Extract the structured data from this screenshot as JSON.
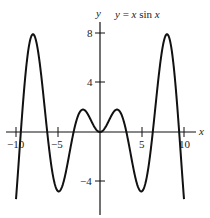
{
  "chart_data": {
    "type": "line",
    "title": "y = x sin x",
    "xlabel": "x",
    "ylabel": "y",
    "xlim": [
      -10.5,
      11.5
    ],
    "ylim": [
      -6.5,
      8.5
    ],
    "grid": false,
    "x_ticks": [
      -10,
      -5,
      5,
      10
    ],
    "x_tick_labels": [
      "−10",
      "−5",
      "5",
      "10"
    ],
    "y_ticks": [
      -4,
      4,
      8
    ],
    "y_tick_labels": [
      "−4",
      "4",
      "8"
    ],
    "series": [
      {
        "name": "y = x sin x",
        "function": "x*sin(x)",
        "domain": [
          -10,
          10
        ],
        "color": "#111111"
      }
    ],
    "key_points": [
      {
        "x": -7.98,
        "y": 7.92
      },
      {
        "x": -4.91,
        "y": -4.81
      },
      {
        "x": -2.03,
        "y": 1.82
      },
      {
        "x": 0,
        "y": 0
      },
      {
        "x": 2.03,
        "y": 1.82
      },
      {
        "x": 4.91,
        "y": -4.81
      },
      {
        "x": 7.98,
        "y": 7.92
      }
    ]
  },
  "labels": {
    "equation_prefix": "y = ",
    "equation_x1": "x",
    "equation_sin": " sin ",
    "equation_x2": "x",
    "x_axis": "x",
    "y_axis": "y"
  }
}
